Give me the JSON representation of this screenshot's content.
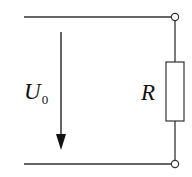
{
  "diagram": {
    "type": "circuit",
    "voltage_label": {
      "symbol": "U",
      "subscript": "0"
    },
    "resistor_label": "R",
    "arrow_direction": "down",
    "components": [
      {
        "kind": "wire",
        "role": "top-conductor"
      },
      {
        "kind": "wire",
        "role": "bottom-conductor"
      },
      {
        "kind": "terminal",
        "role": "top-terminal"
      },
      {
        "kind": "terminal",
        "role": "bottom-terminal"
      },
      {
        "kind": "resistor",
        "label": "R"
      },
      {
        "kind": "voltage-arrow",
        "label": "U0"
      }
    ]
  }
}
